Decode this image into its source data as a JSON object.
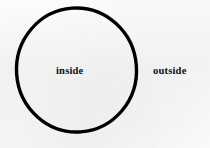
{
  "figure": {
    "background_color": "#fbfbfb",
    "stroke_color": "#000000",
    "label_color": "#101010"
  },
  "curve": {
    "shape_name": "circle",
    "center_x": 76.5,
    "center_y": 70,
    "radius_x": 60,
    "radius_y": 62,
    "stroke_width": 3.4
  },
  "labels": {
    "inside": "inside",
    "outside": "outside"
  }
}
